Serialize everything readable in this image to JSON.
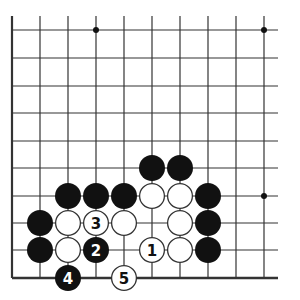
{
  "diagram": {
    "type": "go-board-problem",
    "colors": {
      "black": "#111111",
      "white": "#ffffff",
      "line": "#333333"
    },
    "grid": {
      "columns_x": [
        12,
        40,
        68,
        96,
        124,
        152,
        180,
        208,
        236,
        264
      ],
      "rows_y": [
        30,
        58,
        86,
        113,
        141,
        168,
        196,
        223,
        250,
        278
      ],
      "open_top_extend": 16,
      "open_right_extend": 278,
      "left_edge": true,
      "bottom_edge": true
    },
    "star_points": [
      {
        "col": 3,
        "row": 0
      },
      {
        "col": 9,
        "row": 0
      },
      {
        "col": 9,
        "row": 6
      }
    ],
    "stones": [
      {
        "color": "black",
        "col": 5,
        "row": 5,
        "label": ""
      },
      {
        "color": "black",
        "col": 6,
        "row": 5,
        "label": ""
      },
      {
        "color": "black",
        "col": 2,
        "row": 6,
        "label": ""
      },
      {
        "color": "black",
        "col": 3,
        "row": 6,
        "label": ""
      },
      {
        "color": "black",
        "col": 4,
        "row": 6,
        "label": ""
      },
      {
        "color": "white",
        "col": 5,
        "row": 6,
        "label": ""
      },
      {
        "color": "white",
        "col": 6,
        "row": 6,
        "label": ""
      },
      {
        "color": "black",
        "col": 7,
        "row": 6,
        "label": ""
      },
      {
        "color": "black",
        "col": 1,
        "row": 7,
        "label": ""
      },
      {
        "color": "white",
        "col": 2,
        "row": 7,
        "label": ""
      },
      {
        "color": "white",
        "col": 3,
        "row": 7,
        "label": "3"
      },
      {
        "color": "white",
        "col": 4,
        "row": 7,
        "label": ""
      },
      {
        "color": "white",
        "col": 6,
        "row": 7,
        "label": ""
      },
      {
        "color": "black",
        "col": 7,
        "row": 7,
        "label": ""
      },
      {
        "color": "black",
        "col": 1,
        "row": 8,
        "label": ""
      },
      {
        "color": "white",
        "col": 2,
        "row": 8,
        "label": ""
      },
      {
        "color": "black",
        "col": 3,
        "row": 8,
        "label": "2"
      },
      {
        "color": "white",
        "col": 5,
        "row": 8,
        "label": "1"
      },
      {
        "color": "white",
        "col": 6,
        "row": 8,
        "label": ""
      },
      {
        "color": "black",
        "col": 7,
        "row": 8,
        "label": ""
      },
      {
        "color": "black",
        "col": 2,
        "row": 9,
        "label": "4"
      },
      {
        "color": "white",
        "col": 4,
        "row": 9,
        "label": "5"
      }
    ]
  }
}
